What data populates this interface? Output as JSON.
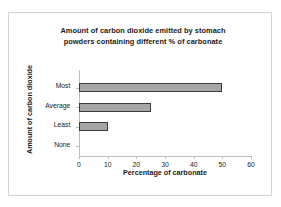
{
  "chart_data": {
    "type": "bar",
    "orientation": "horizontal",
    "title": "Amount of carbon dioxide emitted by stomach powders containing different % of carbonate",
    "title_line1": "Amount of carbon dioxide emitted by stomach",
    "title_line2": "powders containing different % of carbonate",
    "xlabel": "Percentage of carbonate",
    "ylabel": "Amount of carbon dioxide",
    "categories": [
      "Most",
      "Average",
      "Least",
      "None"
    ],
    "values": [
      50,
      25,
      10,
      0
    ],
    "xlim": [
      0,
      60
    ],
    "xticks": [
      0,
      10,
      20,
      30,
      40,
      50,
      60
    ],
    "xtick_labels": [
      "0",
      "10",
      "20",
      "30",
      "40",
      "50",
      "60"
    ],
    "grid": false,
    "legend": null,
    "bar_fill_color": "#a6a6a6",
    "bar_border_color": "#3c3c3c",
    "axis_color": "#bdbdbd",
    "frame_color": "#d2d2d2",
    "background_color": "#ffffff"
  }
}
